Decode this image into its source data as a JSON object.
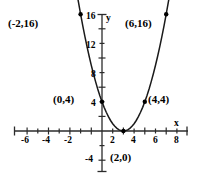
{
  "chart_data": {
    "type": "line",
    "title": "",
    "subtitle": "",
    "xlabel": "x",
    "ylabel": "y",
    "xlim": [
      -7.5,
      8.6
    ],
    "ylim": [
      -5.5,
      17.5
    ],
    "grid": false,
    "legend": null,
    "curve": {
      "name": "parabola",
      "equation": "y = (x - 2)^2",
      "x": [
        -2.6,
        -2.4,
        -2.2,
        -2.0,
        -1.8,
        -1.6,
        -1.4,
        -1.2,
        -1.0,
        -0.8,
        -0.6,
        -0.4,
        -0.2,
        0.0,
        0.2,
        0.4,
        0.6,
        0.8,
        1.0,
        1.2,
        1.4,
        1.6,
        1.8,
        2.0,
        2.2,
        2.4,
        2.6,
        2.8,
        3.0,
        3.2,
        3.4,
        3.6,
        3.8,
        4.0,
        4.2,
        4.4,
        4.6,
        4.8,
        5.0,
        5.2,
        5.4,
        5.6,
        5.8,
        6.0,
        6.3,
        6.6
      ],
      "y": [
        21.16,
        19.36,
        17.64,
        16.0,
        14.44,
        12.96,
        11.56,
        10.24,
        9.0,
        7.84,
        6.76,
        5.76,
        4.84,
        4.0,
        3.24,
        2.56,
        1.96,
        1.44,
        1.0,
        0.64,
        0.36,
        0.16,
        0.04,
        0.0,
        0.04,
        0.16,
        0.36,
        0.64,
        1.0,
        1.44,
        1.96,
        2.56,
        3.24,
        4.0,
        4.84,
        5.76,
        6.76,
        7.84,
        9.0,
        10.24,
        11.56,
        12.96,
        14.44,
        16.0,
        18.49,
        21.16
      ]
    },
    "points": [
      {
        "x": -2,
        "y": 16,
        "label": "(-2,16)",
        "label_position": "left"
      },
      {
        "x": 6,
        "y": 16,
        "label": "(6,16)",
        "label_position": "left-of-point"
      },
      {
        "x": 0,
        "y": 4,
        "label": "(0,4)",
        "label_position": "left"
      },
      {
        "x": 4,
        "y": 4,
        "label": "(4,4)",
        "label_position": "right"
      },
      {
        "x": 2,
        "y": 0,
        "label": "(2,0)",
        "label_position": "below"
      }
    ],
    "x_ticks_labeled": [
      -6,
      -4,
      -2,
      2,
      4,
      6,
      8
    ],
    "x_tick_labels": [
      "-6",
      "-4",
      "-2",
      "2",
      "4",
      "6",
      "8"
    ],
    "x_ticks_minor": [
      -7,
      -5,
      -3,
      -1,
      1,
      3,
      5,
      7
    ],
    "y_ticks_labeled": [
      4,
      8,
      12,
      16,
      -4
    ],
    "y_tick_labels": [
      "4",
      "8",
      "12",
      "16",
      "-4"
    ],
    "y_ticks_minor": [
      2,
      6,
      10,
      14,
      -2
    ]
  },
  "axes": {
    "x_axis_name": "x",
    "y_axis_name": "y"
  },
  "colors": {
    "background": "#ffffff",
    "axis": "#2b2b2b",
    "curve": "#1a1a1a",
    "marker": "#000000",
    "text": "#000000"
  },
  "point_labels": {
    "top_left": "(-2,16)",
    "top_right": "(6,16)",
    "mid_left": "(0,4)",
    "mid_right": "(4,4)",
    "vertex": "(2,0)"
  },
  "x_tick_text": {
    "n6": "-6",
    "n4": "-4",
    "n2": "-2",
    "p2": "2",
    "p4": "4",
    "p6": "6",
    "p8": "8"
  },
  "y_tick_text": {
    "p16": "16",
    "p12": "12",
    "p8": "8",
    "p4": "4",
    "n4": "-4"
  }
}
